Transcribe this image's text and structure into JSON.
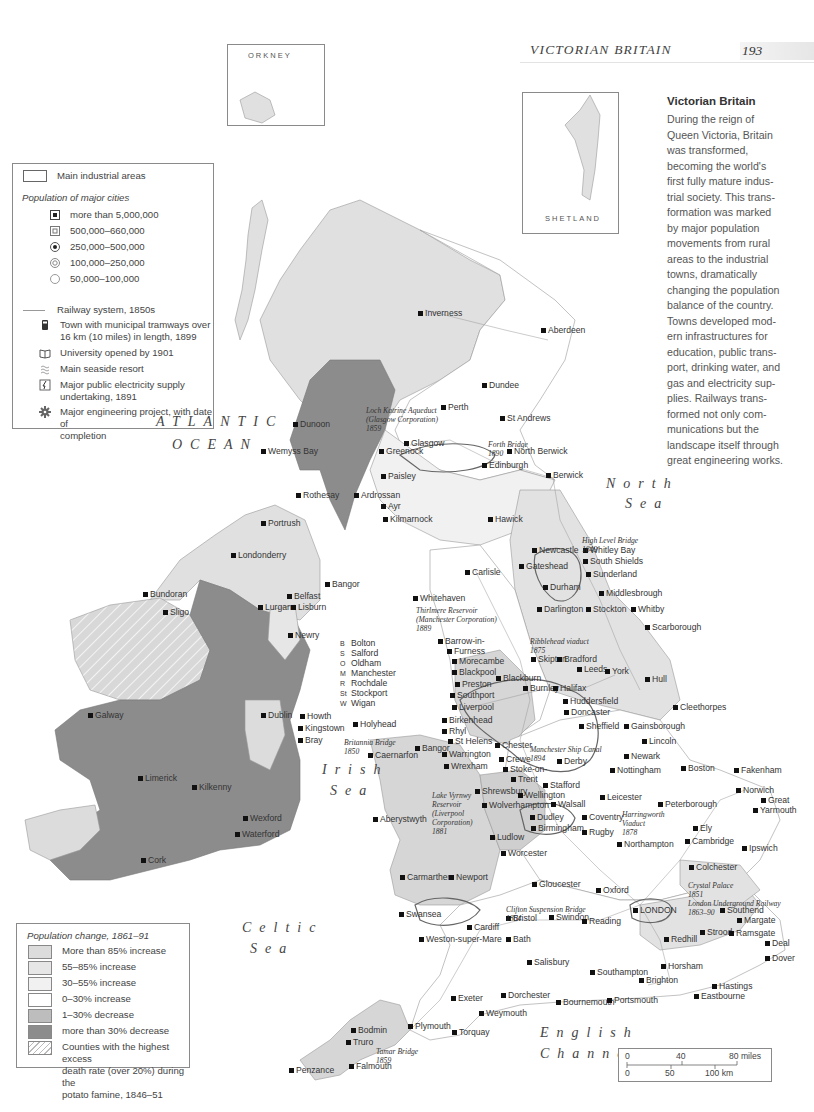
{
  "header": {
    "running_title": "VICTORIAN BRITAIN",
    "page_number": "193"
  },
  "insets": {
    "orkney": "ORKNEY",
    "shetland": "SHETLAND"
  },
  "intro": {
    "title": "Victorian Britain",
    "lines": [
      "During the reign of",
      "Queen Victoria, Britain",
      "was transformed,",
      "becoming the world's",
      "first fully mature indus-",
      "trial society. This trans-",
      "formation was marked",
      "by major population",
      "movements from rural",
      "areas to the industrial",
      "towns, dramatically",
      "changing the population",
      "balance of the country.",
      "Towns developed mod-",
      "ern infrastructures for",
      "education, public trans-",
      "port, drinking water, and",
      "gas and electricity sup-",
      "plies. Railways trans-",
      "formed not only com-",
      "munications but the",
      "landscape itself through",
      "great engineering works."
    ]
  },
  "legend_top": {
    "industrial_areas": "Main industrial areas",
    "population_heading": "Population of major cities",
    "population_classes": [
      {
        "symbol": "filled-square-in-square",
        "label": "more than 5,000,000"
      },
      {
        "symbol": "grid-square",
        "label": "500,000–660,000"
      },
      {
        "symbol": "dot-in-circle",
        "label": "250,000–500,000"
      },
      {
        "symbol": "double-circle",
        "label": "100,000–250,000"
      },
      {
        "symbol": "open-circle",
        "label": "50,000–100,000"
      }
    ],
    "railway": "Railway system, 1850s",
    "tramways": [
      "Town with municipal tramways over",
      "16 km (10 miles) in length, 1899"
    ],
    "university": "University opened by 1901",
    "seaside": "Main seaside resort",
    "electricity": [
      "Major public electricity supply",
      "undertaking, 1891"
    ],
    "engineering": [
      "Major engineering project, with date of",
      "completion"
    ]
  },
  "legend_bottom": {
    "heading": "Population change, 1861–91",
    "classes": [
      {
        "label": "More than 85% increase",
        "color": "#dcdcdc"
      },
      {
        "label": "55–85% increase",
        "color": "#e6e6e6"
      },
      {
        "label": "30–55% increase",
        "color": "#f1f1f1"
      },
      {
        "label": "0–30% increase",
        "color": "#ffffff"
      },
      {
        "label": "1–30% decrease",
        "color": "#bdbdbd"
      },
      {
        "label": "more than 30% decrease",
        "color": "#8c8c8c"
      }
    ],
    "famine": [
      "Counties with the highest excess",
      "death rate (over 20%) during the",
      "potato famine, 1846–51"
    ]
  },
  "seas": {
    "atlantic_1": "ATLANTIC",
    "atlantic_2": "OCEAN",
    "north_1": "North",
    "north_2": "Sea",
    "irish_1": "Irish",
    "irish_2": "Sea",
    "celtic_1": "Celtic",
    "celtic_2": "Sea",
    "english_1": "English",
    "english_2": "Channel"
  },
  "places": [
    {
      "name": "Inverness",
      "x": 425,
      "y": 313
    },
    {
      "name": "Aberdeen",
      "x": 548,
      "y": 330
    },
    {
      "name": "Dundee",
      "x": 489,
      "y": 385
    },
    {
      "name": "Perth",
      "x": 448,
      "y": 407
    },
    {
      "name": "St Andrews",
      "x": 507,
      "y": 418
    },
    {
      "name": "Dunoon",
      "x": 300,
      "y": 424
    },
    {
      "name": "Wemyss Bay",
      "x": 268,
      "y": 451
    },
    {
      "name": "Greenock",
      "x": 386,
      "y": 451
    },
    {
      "name": "Glasgow",
      "x": 411,
      "y": 443
    },
    {
      "name": "North Berwick",
      "x": 514,
      "y": 451
    },
    {
      "name": "Edinburgh",
      "x": 489,
      "y": 465
    },
    {
      "name": "Paisley",
      "x": 388,
      "y": 476
    },
    {
      "name": "Rothesay",
      "x": 303,
      "y": 495
    },
    {
      "name": "Ardrossan",
      "x": 361,
      "y": 495
    },
    {
      "name": "Ayr",
      "x": 388,
      "y": 506
    },
    {
      "name": "Kilmarnock",
      "x": 390,
      "y": 519
    },
    {
      "name": "Berwick",
      "x": 553,
      "y": 475
    },
    {
      "name": "Hawick",
      "x": 495,
      "y": 519
    },
    {
      "name": "Newcastle",
      "x": 539,
      "y": 550
    },
    {
      "name": "Whitley Bay",
      "x": 590,
      "y": 550
    },
    {
      "name": "South Shields",
      "x": 590,
      "y": 561
    },
    {
      "name": "Gateshead",
      "x": 526,
      "y": 566
    },
    {
      "name": "Sunderland",
      "x": 593,
      "y": 574
    },
    {
      "name": "Carlisle",
      "x": 472,
      "y": 572
    },
    {
      "name": "Durham",
      "x": 550,
      "y": 587
    },
    {
      "name": "Middlesbrough",
      "x": 606,
      "y": 593
    },
    {
      "name": "Whitehaven",
      "x": 420,
      "y": 598
    },
    {
      "name": "Darlington",
      "x": 544,
      "y": 609
    },
    {
      "name": "Stockton",
      "x": 593,
      "y": 609
    },
    {
      "name": "Whitby",
      "x": 638,
      "y": 609
    },
    {
      "name": "Scarborough",
      "x": 652,
      "y": 627
    },
    {
      "name": "Barrow-in-",
      "x": 445,
      "y": 641
    },
    {
      "name": "Furness",
      "x": 454,
      "y": 651
    },
    {
      "name": "Morecambe",
      "x": 459,
      "y": 661
    },
    {
      "name": "Skipton",
      "x": 538,
      "y": 659
    },
    {
      "name": "Bradford",
      "x": 564,
      "y": 659
    },
    {
      "name": "Leeds",
      "x": 584,
      "y": 669
    },
    {
      "name": "York",
      "x": 612,
      "y": 671
    },
    {
      "name": "Hull",
      "x": 652,
      "y": 679
    },
    {
      "name": "Blackpool",
      "x": 459,
      "y": 672
    },
    {
      "name": "Preston",
      "x": 462,
      "y": 684
    },
    {
      "name": "Blackburn",
      "x": 503,
      "y": 678
    },
    {
      "name": "Southport",
      "x": 457,
      "y": 695
    },
    {
      "name": "Burnley",
      "x": 530,
      "y": 688
    },
    {
      "name": "Halifax",
      "x": 560,
      "y": 688
    },
    {
      "name": "Liverpool",
      "x": 459,
      "y": 707
    },
    {
      "name": "Birkenhead",
      "x": 449,
      "y": 720
    },
    {
      "name": "Huddersfield",
      "x": 570,
      "y": 701
    },
    {
      "name": "Doncaster",
      "x": 571,
      "y": 712
    },
    {
      "name": "Cleethorpes",
      "x": 680,
      "y": 707
    },
    {
      "name": "Gainsborough",
      "x": 631,
      "y": 726
    },
    {
      "name": "Sheffield",
      "x": 586,
      "y": 726
    },
    {
      "name": "Holyhead",
      "x": 360,
      "y": 724
    },
    {
      "name": "Rhyl",
      "x": 449,
      "y": 731
    },
    {
      "name": "St Helens",
      "x": 455,
      "y": 741
    },
    {
      "name": "Lincoln",
      "x": 649,
      "y": 741
    },
    {
      "name": "Bangor",
      "x": 422,
      "y": 748
    },
    {
      "name": "Caernarfon",
      "x": 375,
      "y": 755
    },
    {
      "name": "Chester",
      "x": 502,
      "y": 745
    },
    {
      "name": "Warrington",
      "x": 449,
      "y": 754
    },
    {
      "name": "Crewe",
      "x": 506,
      "y": 759
    },
    {
      "name": "Derby",
      "x": 564,
      "y": 761
    },
    {
      "name": "Newark",
      "x": 631,
      "y": 756
    },
    {
      "name": "Boston",
      "x": 688,
      "y": 768
    },
    {
      "name": "Wrexham",
      "x": 451,
      "y": 766
    },
    {
      "name": "Stoke-on-",
      "x": 510,
      "y": 769
    },
    {
      "name": "Trent",
      "x": 518,
      "y": 779
    },
    {
      "name": "Nottingham",
      "x": 617,
      "y": 770
    },
    {
      "name": "Fakenham",
      "x": 741,
      "y": 770
    },
    {
      "name": "Stafford",
      "x": 550,
      "y": 785
    },
    {
      "name": "Shrewsbury",
      "x": 482,
      "y": 791
    },
    {
      "name": "Wellington",
      "x": 525,
      "y": 795
    },
    {
      "name": "Norwich",
      "x": 743,
      "y": 790
    },
    {
      "name": "Leicester",
      "x": 607,
      "y": 797
    },
    {
      "name": "Great",
      "x": 768,
      "y": 800
    },
    {
      "name": "Yarmouth",
      "x": 760,
      "y": 810
    },
    {
      "name": "Wolverhampton",
      "x": 489,
      "y": 805
    },
    {
      "name": "Walsall",
      "x": 558,
      "y": 804
    },
    {
      "name": "Peterborough",
      "x": 665,
      "y": 804
    },
    {
      "name": "Aberystwyth",
      "x": 380,
      "y": 819
    },
    {
      "name": "Dudley",
      "x": 537,
      "y": 817
    },
    {
      "name": "Coventry",
      "x": 589,
      "y": 817
    },
    {
      "name": "Ely",
      "x": 700,
      "y": 828
    },
    {
      "name": "Birmingham",
      "x": 538,
      "y": 828
    },
    {
      "name": "Ludlow",
      "x": 497,
      "y": 837
    },
    {
      "name": "Rugby",
      "x": 589,
      "y": 832
    },
    {
      "name": "Northampton",
      "x": 624,
      "y": 844
    },
    {
      "name": "Cambridge",
      "x": 692,
      "y": 841
    },
    {
      "name": "Ipswich",
      "x": 749,
      "y": 848
    },
    {
      "name": "Worcester",
      "x": 508,
      "y": 853
    },
    {
      "name": "Carmarthen",
      "x": 407,
      "y": 877
    },
    {
      "name": "Newport",
      "x": 456,
      "y": 877
    },
    {
      "name": "Colchester",
      "x": 696,
      "y": 867
    },
    {
      "name": "Gloucester",
      "x": 539,
      "y": 884
    },
    {
      "name": "Oxford",
      "x": 603,
      "y": 890
    },
    {
      "name": "Swansea",
      "x": 406,
      "y": 914
    },
    {
      "name": "Bristol",
      "x": 513,
      "y": 918
    },
    {
      "name": "Swindon",
      "x": 556,
      "y": 917
    },
    {
      "name": "Reading",
      "x": 589,
      "y": 921
    },
    {
      "name": "LONDON",
      "x": 640,
      "y": 910
    },
    {
      "name": "Southend",
      "x": 727,
      "y": 910
    },
    {
      "name": "Margate",
      "x": 744,
      "y": 920
    },
    {
      "name": "Cardiff",
      "x": 474,
      "y": 927
    },
    {
      "name": "Strood",
      "x": 707,
      "y": 932
    },
    {
      "name": "Ramsgate",
      "x": 736,
      "y": 933
    },
    {
      "name": "Weston-super-Mare",
      "x": 426,
      "y": 939
    },
    {
      "name": "Bath",
      "x": 513,
      "y": 939
    },
    {
      "name": "Redhill",
      "x": 671,
      "y": 939
    },
    {
      "name": "Deal",
      "x": 772,
      "y": 943
    },
    {
      "name": "Dover",
      "x": 772,
      "y": 958
    },
    {
      "name": "Salisbury",
      "x": 534,
      "y": 962
    },
    {
      "name": "Horsham",
      "x": 668,
      "y": 966
    },
    {
      "name": "Southampton",
      "x": 597,
      "y": 972
    },
    {
      "name": "Brighton",
      "x": 646,
      "y": 980
    },
    {
      "name": "Hastings",
      "x": 719,
      "y": 986
    },
    {
      "name": "Exeter",
      "x": 458,
      "y": 998
    },
    {
      "name": "Dorchester",
      "x": 508,
      "y": 995
    },
    {
      "name": "Bournemouth",
      "x": 563,
      "y": 1002
    },
    {
      "name": "Portsmouth",
      "x": 614,
      "y": 1000
    },
    {
      "name": "Eastbourne",
      "x": 701,
      "y": 996
    },
    {
      "name": "Weymouth",
      "x": 486,
      "y": 1013
    },
    {
      "name": "Plymouth",
      "x": 415,
      "y": 1026
    },
    {
      "name": "Torquay",
      "x": 459,
      "y": 1032
    },
    {
      "name": "Bodmin",
      "x": 358,
      "y": 1030
    },
    {
      "name": "Truro",
      "x": 353,
      "y": 1042
    },
    {
      "name": "Falmouth",
      "x": 356,
      "y": 1066
    },
    {
      "name": "Penzance",
      "x": 296,
      "y": 1070
    },
    {
      "name": "Portrush",
      "x": 268,
      "y": 523
    },
    {
      "name": "Londonderry",
      "x": 238,
      "y": 555
    },
    {
      "name": "Bangor",
      "x": 332,
      "y": 584
    },
    {
      "name": "Belfast",
      "x": 294,
      "y": 596
    },
    {
      "name": "Bundoran",
      "x": 150,
      "y": 594
    },
    {
      "name": "Lurgan",
      "x": 265,
      "y": 607
    },
    {
      "name": "Lisburn",
      "x": 298,
      "y": 607
    },
    {
      "name": "Sligo",
      "x": 170,
      "y": 612
    },
    {
      "name": "Newry",
      "x": 295,
      "y": 635
    },
    {
      "name": "Galway",
      "x": 95,
      "y": 715
    },
    {
      "name": "Dublin",
      "x": 268,
      "y": 715
    },
    {
      "name": "Howth",
      "x": 307,
      "y": 716
    },
    {
      "name": "Kingstown",
      "x": 305,
      "y": 728
    },
    {
      "name": "Bray",
      "x": 305,
      "y": 740
    },
    {
      "name": "Limerick",
      "x": 145,
      "y": 778
    },
    {
      "name": "Kilkenny",
      "x": 199,
      "y": 787
    },
    {
      "name": "Wexford",
      "x": 250,
      "y": 818
    },
    {
      "name": "Waterford",
      "x": 242,
      "y": 834
    },
    {
      "name": "Cork",
      "x": 148,
      "y": 860
    }
  ],
  "cheshire_key": [
    {
      "letter": "B",
      "name": "Bolton"
    },
    {
      "letter": "S",
      "name": "Salford"
    },
    {
      "letter": "O",
      "name": "Oldham"
    },
    {
      "letter": "M",
      "name": "Manchester"
    },
    {
      "letter": "R",
      "name": "Rochdale"
    },
    {
      "letter": "St",
      "name": "Stockport"
    },
    {
      "letter": "W",
      "name": "Wigan"
    }
  ],
  "engineering_projects": [
    {
      "text": [
        "Loch Katrine Aqueduct",
        "(Glasgow Corporation)",
        "1859"
      ],
      "x": 366,
      "y": 406
    },
    {
      "text": [
        "Forth Bridge",
        "1890"
      ],
      "x": 488,
      "y": 440
    },
    {
      "text": [
        "High Level Bridge",
        "1849"
      ],
      "x": 582,
      "y": 536
    },
    {
      "text": [
        "Thirlmere Reservoir",
        "(Manchester Corporation)",
        "1889"
      ],
      "x": 416,
      "y": 606
    },
    {
      "text": [
        "Ribblehead viaduct",
        "1875"
      ],
      "x": 530,
      "y": 637
    },
    {
      "text": [
        "Britannia Bridge",
        "1850"
      ],
      "x": 344,
      "y": 738
    },
    {
      "text": [
        "Manchester Ship Canal",
        "1894"
      ],
      "x": 530,
      "y": 745
    },
    {
      "text": [
        "Lake Vyrnwy",
        "Reservoir",
        "(Liverpool",
        "Corporation)",
        "1881"
      ],
      "x": 432,
      "y": 791
    },
    {
      "text": [
        "Harringworth",
        "Viaduct",
        "1878"
      ],
      "x": 622,
      "y": 810
    },
    {
      "text": [
        "Crystal Palace",
        "1851",
        "London Underground Railway",
        "1863–90"
      ],
      "x": 688,
      "y": 881
    },
    {
      "text": [
        "Clifton Suspension Bridge",
        "1864"
      ],
      "x": 506,
      "y": 905
    },
    {
      "text": [
        "Tamar Bridge",
        "1859"
      ],
      "x": 376,
      "y": 1047
    }
  ],
  "scale_bar": {
    "miles": [
      "0",
      "40",
      "80 miles"
    ],
    "km": [
      "0",
      "50",
      "100 km"
    ]
  }
}
